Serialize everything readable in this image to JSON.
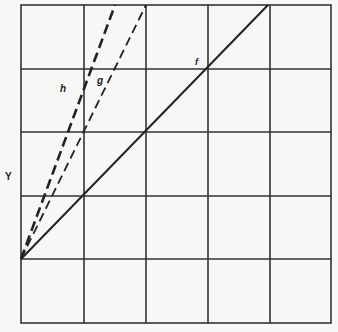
{
  "diagram": {
    "grid": {
      "columns": 5,
      "rows": 5,
      "cell_width": 62,
      "cell_height": 63.6,
      "origin_x": 21,
      "origin_y": 5
    },
    "lines": [
      {
        "id": "f",
        "label": "f",
        "style": "solid",
        "from": [
          0,
          1
        ],
        "to": [
          4,
          5
        ]
      },
      {
        "id": "g",
        "label": "g",
        "style": "dashed",
        "from": [
          0,
          1
        ],
        "to": [
          2,
          5
        ]
      },
      {
        "id": "h",
        "label": "h",
        "style": "dashed-heavy",
        "from": [
          0,
          1
        ],
        "to": [
          1.5,
          5
        ]
      }
    ],
    "axis_label": "Y",
    "colors": {
      "line": "#222222",
      "grid": "#333333",
      "background": "#f7f7f5"
    }
  }
}
